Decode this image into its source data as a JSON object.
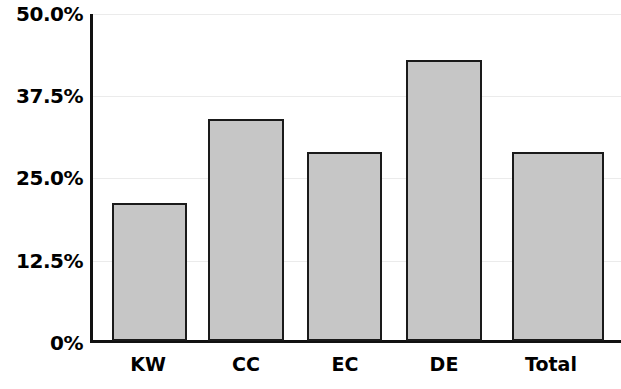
{
  "chart_data": {
    "type": "bar",
    "title": "",
    "subtitle": "",
    "xlabel": "",
    "ylabel": "",
    "categories": [
      "KW",
      "CC",
      "EC",
      "DE",
      "Total"
    ],
    "values": [
      21.0,
      33.7,
      28.7,
      42.7,
      28.7
    ],
    "value_labels": [
      "",
      "",
      "",
      "",
      ""
    ],
    "ylim": [
      0,
      50
    ],
    "yticks": [
      0,
      12.5,
      25.0,
      37.5,
      50.0
    ],
    "ytick_labels": [
      "0%",
      "12.5%",
      "25.0%",
      "37.5%",
      "50.0%"
    ],
    "grid": true,
    "grid_axis": "y",
    "legend": false,
    "legend_position": "none",
    "bar_fill_color": "#c6c6c6",
    "bar_edge_color": "#1a1a1a",
    "gridline_color": "#ebebeb",
    "axis_color": "#111111",
    "background_color": "#ffffff"
  }
}
